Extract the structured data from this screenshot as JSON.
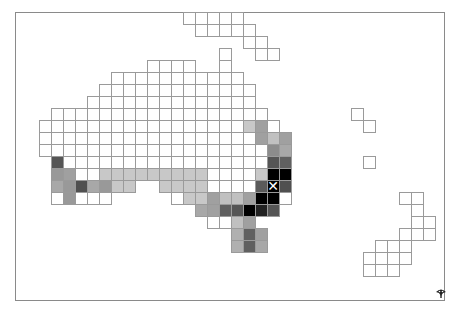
{
  "map": {
    "cell_size": 12,
    "origin_x": 3,
    "origin_y": 12,
    "border_color": "#9a9a9a",
    "regions": [
      {
        "name": "new-guinea",
        "cells": [
          [
            0,
            15,
            "#ffffff"
          ],
          [
            0,
            16,
            "#ffffff"
          ],
          [
            0,
            17,
            "#ffffff"
          ],
          [
            0,
            18,
            "#ffffff"
          ],
          [
            0,
            19,
            "#ffffff"
          ],
          [
            1,
            16,
            "#ffffff"
          ],
          [
            1,
            17,
            "#ffffff"
          ],
          [
            1,
            18,
            "#ffffff"
          ],
          [
            1,
            19,
            "#ffffff"
          ],
          [
            1,
            20,
            "#ffffff"
          ],
          [
            2,
            20,
            "#ffffff"
          ],
          [
            2,
            21,
            "#ffffff"
          ],
          [
            3,
            21,
            "#ffffff"
          ],
          [
            3,
            22,
            "#ffffff"
          ]
        ]
      },
      {
        "name": "australia",
        "rows": [
          {
            "r": 3,
            "cells": [
              [
                18,
                "#ffffff"
              ]
            ]
          },
          {
            "r": 4,
            "cells": [
              [
                12,
                "#ffffff"
              ],
              [
                13,
                "#ffffff"
              ],
              [
                14,
                "#ffffff"
              ],
              [
                15,
                "#ffffff"
              ],
              [
                18,
                "#ffffff"
              ]
            ]
          },
          {
            "r": 5,
            "range": [
              9,
              19
            ],
            "color": "#ffffff"
          },
          {
            "r": 6,
            "range": [
              8,
              20
            ],
            "color": "#ffffff"
          },
          {
            "r": 7,
            "range": [
              7,
              20
            ],
            "color": "#ffffff"
          },
          {
            "r": 8,
            "range": [
              4,
              21
            ],
            "color": "#ffffff"
          },
          {
            "r": 9,
            "range": [
              3,
              22
            ],
            "color": "#ffffff",
            "overrides": [
              [
                20,
                "#c8c8c8"
              ],
              [
                21,
                "#a0a0a0"
              ]
            ]
          },
          {
            "r": 10,
            "range": [
              3,
              23
            ],
            "color": "#ffffff",
            "overrides": [
              [
                21,
                "#a0a0a0"
              ],
              [
                22,
                "#c0c0c0"
              ],
              [
                23,
                "#a0a0a0"
              ]
            ]
          },
          {
            "r": 11,
            "range": [
              3,
              23
            ],
            "color": "#ffffff",
            "overrides": [
              [
                22,
                "#8c8c8c"
              ],
              [
                23,
                "#a8a8a8"
              ]
            ]
          },
          {
            "r": 12,
            "range": [
              4,
              23
            ],
            "color": "#ffffff",
            "overrides": [
              [
                4,
                "#555555"
              ],
              [
                22,
                "#555555"
              ],
              [
                23,
                "#606060"
              ]
            ]
          },
          {
            "r": 13,
            "range": [
              4,
              23
            ],
            "color": "#ffffff",
            "overrides": [
              [
                4,
                "#999999"
              ],
              [
                5,
                "#a0a0a0"
              ],
              [
                8,
                "#c8c8c8"
              ],
              [
                9,
                "#c8c8c8"
              ],
              [
                10,
                "#c8c8c8"
              ],
              [
                11,
                "#c8c8c8"
              ],
              [
                12,
                "#c8c8c8"
              ],
              [
                13,
                "#c8c8c8"
              ],
              [
                14,
                "#c8c8c8"
              ],
              [
                15,
                "#c8c8c8"
              ],
              [
                16,
                "#c8c8c8"
              ],
              [
                21,
                "#c8c8c8"
              ],
              [
                22,
                "#000000"
              ],
              [
                23,
                "#000000"
              ]
            ]
          },
          {
            "r": 14,
            "cells": [
              [
                4,
                "#a8a8a8"
              ],
              [
                5,
                "#999999"
              ],
              [
                6,
                "#505050"
              ],
              [
                7,
                "#a8a8a8"
              ],
              [
                8,
                "#999999"
              ],
              [
                9,
                "#c8c8c8"
              ],
              [
                10,
                "#c8c8c8"
              ],
              [
                13,
                "#c8c8c8"
              ],
              [
                14,
                "#c8c8c8"
              ],
              [
                15,
                "#c8c8c8"
              ],
              [
                16,
                "#c8c8c8"
              ],
              [
                17,
                "#ffffff"
              ],
              [
                18,
                "#ffffff"
              ],
              [
                19,
                "#ffffff"
              ],
              [
                20,
                "#ffffff"
              ],
              [
                21,
                "#5a5a5a"
              ],
              [
                22,
                "#000000"
              ],
              [
                23,
                "#505050"
              ]
            ]
          },
          {
            "r": 15,
            "cells": [
              [
                4,
                "#ffffff"
              ],
              [
                5,
                "#999999"
              ],
              [
                6,
                "#ffffff"
              ],
              [
                7,
                "#ffffff"
              ],
              [
                8,
                "#ffffff"
              ],
              [
                14,
                "#ffffff"
              ],
              [
                15,
                "#c8c8c8"
              ],
              [
                16,
                "#c8c8c8"
              ],
              [
                17,
                "#a0a0a0"
              ],
              [
                18,
                "#c0c0c0"
              ],
              [
                19,
                "#c0c0c0"
              ],
              [
                20,
                "#a0a0a0"
              ],
              [
                21,
                "#000000"
              ],
              [
                22,
                "#000000"
              ],
              [
                23,
                "#ffffff"
              ]
            ]
          },
          {
            "r": 16,
            "cells": [
              [
                16,
                "#a8a8a8"
              ],
              [
                17,
                "#a0a0a0"
              ],
              [
                18,
                "#606060"
              ],
              [
                19,
                "#555555"
              ],
              [
                20,
                "#000000"
              ],
              [
                21,
                "#222222"
              ],
              [
                22,
                "#555555"
              ]
            ]
          },
          {
            "r": 17,
            "cells": [
              [
                17,
                "#ffffff"
              ],
              [
                18,
                "#ffffff"
              ],
              [
                19,
                "#c0c0c0"
              ],
              [
                20,
                "#a0a0a0"
              ]
            ]
          },
          {
            "r": 18,
            "cells": [
              [
                19,
                "#b0b0b0"
              ],
              [
                20,
                "#606060"
              ],
              [
                21,
                "#a0a0a0"
              ]
            ]
          },
          {
            "r": 19,
            "cells": [
              [
                19,
                "#b0b0b0"
              ],
              [
                20,
                "#606060"
              ],
              [
                21,
                "#a8a8a8"
              ]
            ]
          }
        ]
      },
      {
        "name": "pacific-islands",
        "cells": [
          [
            8,
            29,
            "#ffffff"
          ],
          [
            9,
            30,
            "#ffffff"
          ],
          [
            12,
            30,
            "#ffffff"
          ]
        ]
      },
      {
        "name": "new-zealand",
        "cells": [
          [
            15,
            33,
            "#ffffff"
          ],
          [
            15,
            34,
            "#ffffff"
          ],
          [
            16,
            34,
            "#ffffff"
          ],
          [
            17,
            34,
            "#ffffff"
          ],
          [
            17,
            35,
            "#ffffff"
          ],
          [
            18,
            33,
            "#ffffff"
          ],
          [
            18,
            34,
            "#ffffff"
          ],
          [
            18,
            35,
            "#ffffff"
          ],
          [
            19,
            31,
            "#ffffff"
          ],
          [
            19,
            32,
            "#ffffff"
          ],
          [
            19,
            33,
            "#ffffff"
          ],
          [
            20,
            30,
            "#ffffff"
          ],
          [
            20,
            31,
            "#ffffff"
          ],
          [
            20,
            32,
            "#ffffff"
          ],
          [
            20,
            33,
            "#ffffff"
          ],
          [
            21,
            30,
            "#ffffff"
          ],
          [
            21,
            31,
            "#ffffff"
          ],
          [
            21,
            32,
            "#ffffff"
          ]
        ]
      }
    ],
    "marker": {
      "symbol": "✕",
      "row": 14,
      "col": 22,
      "color": "#ffffff"
    },
    "logo": {
      "icon": "tree-logo-icon",
      "color": "#222222"
    }
  }
}
